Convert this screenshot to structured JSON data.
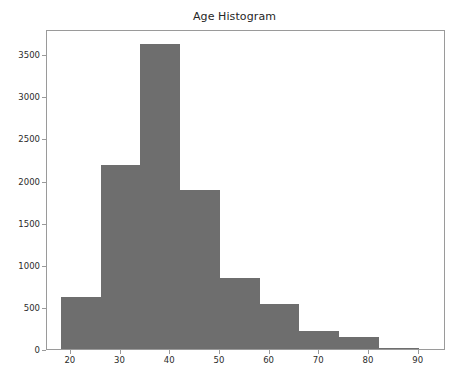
{
  "chart_data": {
    "type": "bar",
    "title": "Age Histogram",
    "xlabel": "",
    "ylabel": "",
    "grid": false,
    "legend": null,
    "xlim": [
      15.2,
      95.5
    ],
    "ylim": [
      0,
      3800
    ],
    "xticks": [
      20,
      30,
      40,
      50,
      60,
      70,
      80,
      90
    ],
    "xtick_labels": [
      "20",
      "30",
      "40",
      "50",
      "60",
      "70",
      "80",
      "90"
    ],
    "yticks": [
      0,
      500,
      1000,
      1500,
      2000,
      2500,
      3000,
      3500
    ],
    "ytick_labels": [
      "0",
      "500",
      "1000",
      "1500",
      "2000",
      "2500",
      "3000",
      "3500"
    ],
    "bin_edges": [
      18,
      26,
      34,
      42,
      50,
      58,
      66,
      74,
      82,
      90
    ],
    "bin_labels": [
      "18-26",
      "26-34",
      "34-42",
      "42-50",
      "50-58",
      "58-66",
      "66-74",
      "74-82",
      "82-90"
    ],
    "values": [
      620,
      2190,
      3620,
      1890,
      840,
      530,
      215,
      140,
      10
    ],
    "bar_color": "#6e6e6e",
    "axes_color": "#9a9a9a",
    "text_color": "#2b2b2b"
  }
}
